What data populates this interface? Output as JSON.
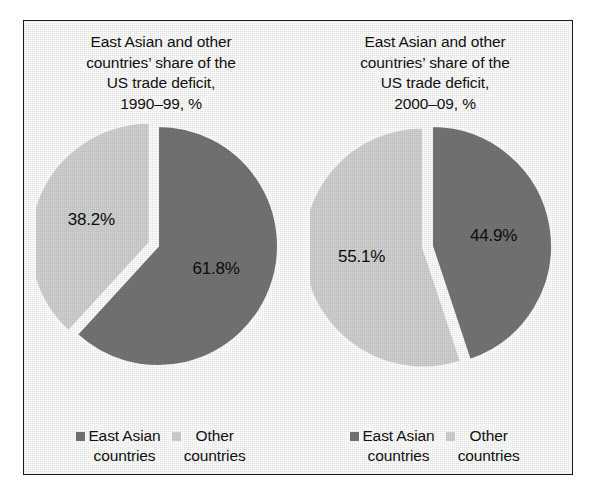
{
  "figure": {
    "border_color": "#1a1a1a",
    "background": "#ffffff"
  },
  "colors": {
    "dark_slice": "#757575",
    "light_slice": "#d2d2d2",
    "gap": "#ffffff",
    "text": "#111111"
  },
  "legend": {
    "east_asian_label": "East Asian\ncountries",
    "other_label": "Other\ncountries",
    "east_asian_swatch_color": "#757575",
    "other_swatch_color": "#d2d2d2"
  },
  "chart_data": [
    {
      "type": "pie",
      "title": "East Asian and other\ncountries’ share of the\nUS trade deficit,\n1990–99, %",
      "period": "1990–99",
      "unit": "%",
      "categories": [
        "East Asian countries",
        "Other countries"
      ],
      "values": [
        61.8,
        38.2
      ],
      "labels": [
        "61.8%",
        "38.2%"
      ],
      "colors": [
        "#757575",
        "#d2d2d2"
      ],
      "start_angle_deg": 0,
      "direction": "clockwise",
      "exploded": [
        "Other countries"
      ],
      "legend_position": "bottom"
    },
    {
      "type": "pie",
      "title": "East Asian and other\ncountries’ share of the\nUS trade deficit,\n2000–09, %",
      "period": "2000–09",
      "unit": "%",
      "categories": [
        "East Asian countries",
        "Other countries"
      ],
      "values": [
        44.9,
        55.1
      ],
      "labels": [
        "44.9%",
        "55.1%"
      ],
      "colors": [
        "#757575",
        "#d2d2d2"
      ],
      "start_angle_deg": 0,
      "direction": "clockwise",
      "exploded": [
        "Other countries"
      ],
      "legend_position": "bottom"
    }
  ]
}
